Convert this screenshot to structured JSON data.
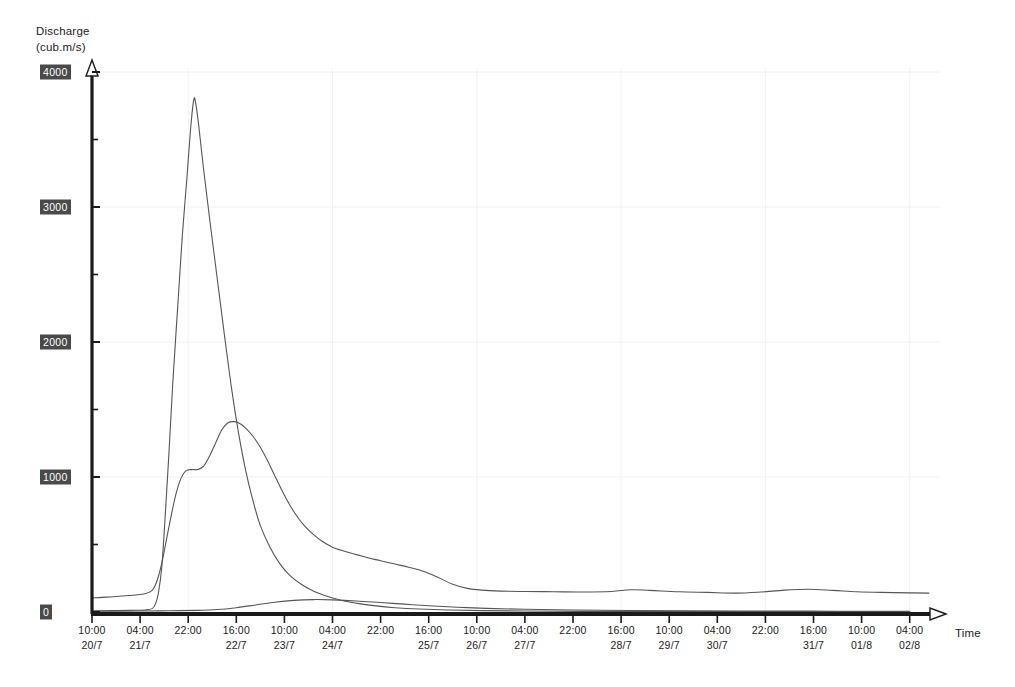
{
  "chart_data": {
    "type": "line",
    "title": "",
    "ylabel": "Discharge",
    "yunits": "(cub.m/s)",
    "xlabel": "Time",
    "ylim": [
      0,
      4000
    ],
    "y_ticks": [
      0,
      1000,
      2000,
      3000,
      4000
    ],
    "y_minor_step": 500,
    "grid": true,
    "legend": "none",
    "x_ticks": [
      {
        "time": "10:00",
        "date": "20/7"
      },
      {
        "time": "04:00",
        "date": "21/7"
      },
      {
        "time": "22:00",
        "date": ""
      },
      {
        "time": "16:00",
        "date": "22/7"
      },
      {
        "time": "10:00",
        "date": "23/7"
      },
      {
        "time": "04:00",
        "date": "24/7"
      },
      {
        "time": "22:00",
        "date": ""
      },
      {
        "time": "16:00",
        "date": "25/7"
      },
      {
        "time": "10:00",
        "date": "26/7"
      },
      {
        "time": "04:00",
        "date": "27/7"
      },
      {
        "time": "22:00",
        "date": ""
      },
      {
        "time": "16:00",
        "date": "28/7"
      },
      {
        "time": "10:00",
        "date": "29/7"
      },
      {
        "time": "04:00",
        "date": "30/7"
      },
      {
        "time": "22:00",
        "date": ""
      },
      {
        "time": "16:00",
        "date": "31/7"
      },
      {
        "time": "10:00",
        "date": "01/8"
      },
      {
        "time": "04:00",
        "date": "02/8"
      }
    ],
    "series": [
      {
        "name": "peak-hydrograph",
        "color": "#555555",
        "points": [
          [
            0.0,
            8
          ],
          [
            0.4,
            10
          ],
          [
            0.8,
            12
          ],
          [
            1.1,
            15
          ],
          [
            1.25,
            25
          ],
          [
            1.32,
            60
          ],
          [
            1.38,
            140
          ],
          [
            1.45,
            330
          ],
          [
            1.52,
            700
          ],
          [
            1.6,
            1180
          ],
          [
            1.68,
            1700
          ],
          [
            1.78,
            2250
          ],
          [
            1.88,
            2800
          ],
          [
            1.98,
            3250
          ],
          [
            2.06,
            3620
          ],
          [
            2.12,
            3800
          ],
          [
            2.16,
            3760
          ],
          [
            2.22,
            3600
          ],
          [
            2.32,
            3280
          ],
          [
            2.45,
            2900
          ],
          [
            2.6,
            2480
          ],
          [
            2.75,
            2060
          ],
          [
            2.9,
            1660
          ],
          [
            3.05,
            1320
          ],
          [
            3.2,
            1040
          ],
          [
            3.35,
            820
          ],
          [
            3.5,
            640
          ],
          [
            3.7,
            480
          ],
          [
            3.9,
            360
          ],
          [
            4.1,
            275
          ],
          [
            4.35,
            205
          ],
          [
            4.6,
            155
          ],
          [
            4.9,
            115
          ],
          [
            5.2,
            85
          ],
          [
            5.55,
            62
          ],
          [
            5.9,
            45
          ],
          [
            6.3,
            32
          ],
          [
            6.8,
            22
          ],
          [
            7.4,
            15
          ],
          [
            8.1,
            10
          ],
          [
            9.0,
            7
          ],
          [
            10.2,
            5
          ],
          [
            12.0,
            4
          ],
          [
            14.0,
            3
          ],
          [
            17.0,
            3
          ]
        ]
      },
      {
        "name": "broad-hydrograph",
        "color": "#555555",
        "points": [
          [
            0.0,
            105
          ],
          [
            0.3,
            110
          ],
          [
            0.6,
            118
          ],
          [
            0.9,
            126
          ],
          [
            1.1,
            135
          ],
          [
            1.25,
            160
          ],
          [
            1.35,
            230
          ],
          [
            1.45,
            360
          ],
          [
            1.55,
            540
          ],
          [
            1.65,
            720
          ],
          [
            1.75,
            880
          ],
          [
            1.85,
            990
          ],
          [
            1.95,
            1045
          ],
          [
            2.08,
            1055
          ],
          [
            2.2,
            1055
          ],
          [
            2.32,
            1080
          ],
          [
            2.45,
            1160
          ],
          [
            2.58,
            1260
          ],
          [
            2.7,
            1350
          ],
          [
            2.82,
            1400
          ],
          [
            2.95,
            1410
          ],
          [
            3.08,
            1395
          ],
          [
            3.2,
            1360
          ],
          [
            3.35,
            1300
          ],
          [
            3.5,
            1220
          ],
          [
            3.65,
            1120
          ],
          [
            3.8,
            1010
          ],
          [
            3.95,
            900
          ],
          [
            4.1,
            800
          ],
          [
            4.25,
            715
          ],
          [
            4.4,
            645
          ],
          [
            4.6,
            575
          ],
          [
            4.8,
            520
          ],
          [
            5.0,
            480
          ],
          [
            5.25,
            450
          ],
          [
            5.5,
            425
          ],
          [
            5.75,
            400
          ],
          [
            6.0,
            380
          ],
          [
            6.3,
            355
          ],
          [
            6.6,
            330
          ],
          [
            6.9,
            300
          ],
          [
            7.2,
            255
          ],
          [
            7.5,
            205
          ],
          [
            7.8,
            175
          ],
          [
            8.1,
            162
          ],
          [
            8.5,
            155
          ],
          [
            9.0,
            152
          ],
          [
            9.6,
            150
          ],
          [
            10.2,
            148
          ],
          [
            10.8,
            152
          ],
          [
            11.2,
            165
          ],
          [
            11.6,
            160
          ],
          [
            12.2,
            150
          ],
          [
            12.8,
            145
          ],
          [
            13.4,
            140
          ],
          [
            13.9,
            148
          ],
          [
            14.4,
            162
          ],
          [
            14.9,
            168
          ],
          [
            15.4,
            160
          ],
          [
            15.9,
            150
          ],
          [
            16.4,
            145
          ],
          [
            17.0,
            142
          ],
          [
            17.4,
            140
          ]
        ]
      },
      {
        "name": "baseflow-bump",
        "color": "#555555",
        "points": [
          [
            0.0,
            6
          ],
          [
            1.0,
            7
          ],
          [
            1.6,
            9
          ],
          [
            2.2,
            12
          ],
          [
            2.6,
            18
          ],
          [
            3.0,
            32
          ],
          [
            3.4,
            52
          ],
          [
            3.8,
            72
          ],
          [
            4.2,
            86
          ],
          [
            4.6,
            92
          ],
          [
            5.0,
            90
          ],
          [
            5.5,
            82
          ],
          [
            6.0,
            70
          ],
          [
            6.5,
            58
          ],
          [
            7.0,
            46
          ],
          [
            7.6,
            35
          ],
          [
            8.2,
            27
          ],
          [
            9.0,
            20
          ],
          [
            10.0,
            15
          ],
          [
            11.2,
            11
          ],
          [
            12.5,
            9
          ],
          [
            14.0,
            7
          ],
          [
            15.5,
            6
          ],
          [
            17.0,
            5
          ]
        ]
      }
    ]
  }
}
